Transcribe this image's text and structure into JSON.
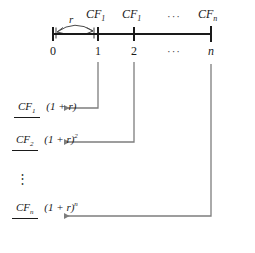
{
  "figure": {
    "type": "timeline-diagram"
  },
  "timeline": {
    "rate_label": "r",
    "periods": [
      {
        "key": "t0",
        "label": "0"
      },
      {
        "key": "t1",
        "label": "1"
      },
      {
        "key": "t2",
        "label": "2"
      },
      {
        "key": "tdots",
        "label": "···"
      },
      {
        "key": "tn",
        "label": "n"
      }
    ],
    "cashflow_labels": [
      {
        "key": "cf1",
        "base": "CF",
        "sub": "1"
      },
      {
        "key": "cf2",
        "base": "CF",
        "sub": "1"
      },
      {
        "key": "cfdots",
        "base": "···",
        "sub": ""
      },
      {
        "key": "cfn",
        "base": "CF",
        "sub": "n"
      }
    ]
  },
  "present_values": [
    {
      "key": "pv1",
      "numerator_base": "CF",
      "numerator_sub": "1",
      "denominator": "(1 + r)",
      "denominator_exp": ""
    },
    {
      "key": "pv2",
      "numerator_base": "CF",
      "numerator_sub": "2",
      "denominator": "(1 + r)",
      "denominator_exp": "2"
    },
    {
      "key": "pvn",
      "numerator_base": "CF",
      "numerator_sub": "n",
      "denominator": "(1 + r)",
      "denominator_exp": "n"
    }
  ],
  "vertical_ellipsis": "⋮",
  "colors": {
    "axis": "#1a1a1a",
    "connector": "#7d7d7d",
    "text": "#1a1a1a"
  }
}
